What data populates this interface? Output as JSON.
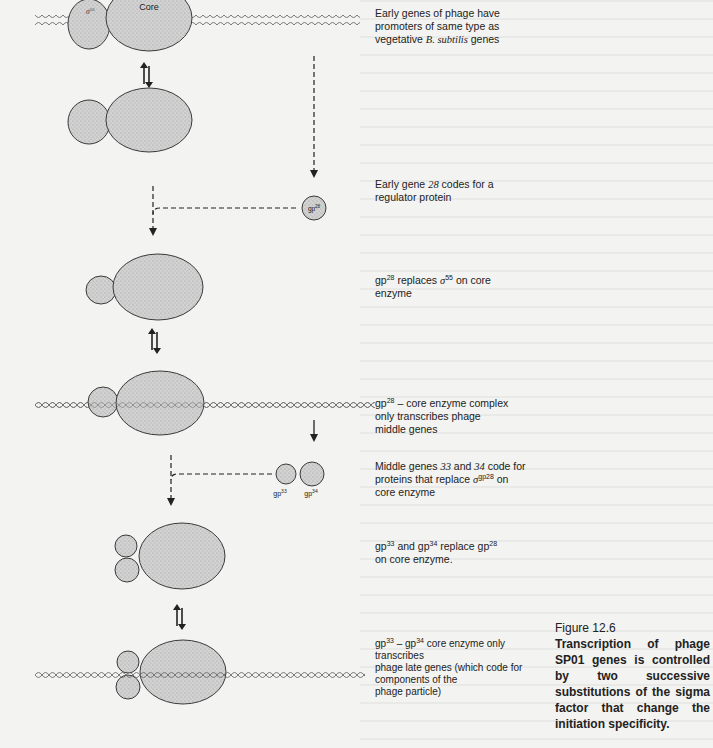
{
  "figure": {
    "number": "Figure 12.6",
    "caption": "Transcription of phage SP01 genes is controlled by two successive substitutions of the sigma factor that change the initiation specificity."
  },
  "diagram_labels": {
    "core": "Core",
    "sigma55": "σ55",
    "gp28": "gp28",
    "gp33": "gp33",
    "gp34": "gp34"
  },
  "annotations": [
    {
      "id": "early-genes",
      "lines": [
        "Early genes of phage have",
        "promoters of same type as",
        "vegetative B. subtilis genes"
      ]
    },
    {
      "id": "early-gene-28",
      "lines": [
        "Early gene 28 codes for a",
        "regulator protein"
      ]
    },
    {
      "id": "gp28-replaces",
      "lines": [
        "gp28 replaces σ55 on core",
        "enzyme"
      ]
    },
    {
      "id": "gp28-core-complex",
      "lines": [
        "gp28 – core enzyme complex",
        "only transcribes phage",
        "middle genes"
      ]
    },
    {
      "id": "middle-genes",
      "lines": [
        "Middle genes 33 and 34 code for",
        "proteins that replace σgp28 on",
        "core enzyme"
      ]
    },
    {
      "id": "gp33-gp34-replace",
      "lines": [
        "gp33 and gp34 replace gp28",
        "on core enzyme."
      ]
    },
    {
      "id": "gp33-gp34-core",
      "lines": [
        "gp33 – gp34 core enzyme only",
        "transcribes",
        "phage late genes (which code for",
        "components of the",
        "phage particle)"
      ]
    }
  ],
  "colors": {
    "protein_fill": "#cfcfcf",
    "outline": "#3a3a3a",
    "dna": "#6a6a6a",
    "page": "#f3f3f1"
  }
}
